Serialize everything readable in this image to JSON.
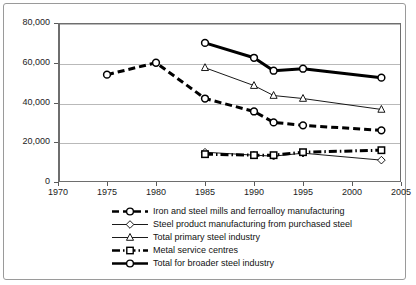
{
  "chart_data": {
    "type": "line",
    "title": "",
    "xlabel": "",
    "ylabel": "",
    "xlim": [
      1970,
      2005
    ],
    "ylim": [
      0,
      80000
    ],
    "grid": true,
    "legend_position": "bottom",
    "yticks": [
      "0",
      "20,000",
      "40,000",
      "60,000",
      "80,000"
    ],
    "ytick_values": [
      0,
      20000,
      40000,
      60000,
      80000
    ],
    "xticks": [
      "1970",
      "1975",
      "1980",
      "1985",
      "1990",
      "1995",
      "2000",
      "2005"
    ],
    "xtick_values": [
      1970,
      1975,
      1980,
      1985,
      1990,
      1995,
      2000,
      2005
    ],
    "series": [
      {
        "name": "Iron and steel mills and ferroalloy manufacturing",
        "marker": "circle",
        "line_style": "dashed",
        "line_width": "thick",
        "x": [
          1975,
          1980,
          1985,
          1990,
          1992,
          1995,
          2003
        ],
        "values": [
          54000,
          60000,
          42000,
          35500,
          30000,
          28500,
          26000
        ]
      },
      {
        "name": "Steel product manufacturing from purchased steel",
        "marker": "diamond",
        "line_style": "solid",
        "line_width": "thin",
        "x": [
          1985,
          1990,
          1992,
          1995,
          2003
        ],
        "values": [
          15000,
          13500,
          13000,
          14500,
          11000
        ]
      },
      {
        "name": "Total primary steel industry",
        "marker": "triangle",
        "line_style": "solid",
        "line_width": "thin",
        "x": [
          1985,
          1990,
          1992,
          1995,
          2003
        ],
        "values": [
          57500,
          48500,
          43500,
          42000,
          36500
        ]
      },
      {
        "name": "Metal service centres",
        "marker": "square",
        "line_style": "dash-dot",
        "line_width": "thick",
        "x": [
          1985,
          1990,
          1992,
          1995,
          2003
        ],
        "values": [
          14000,
          13500,
          13500,
          15000,
          16000
        ]
      },
      {
        "name": "Total for broader steel industry",
        "marker": "circle",
        "line_style": "solid",
        "line_width": "thick",
        "x": [
          1985,
          1990,
          1992,
          1995,
          2003
        ],
        "values": [
          70000,
          62500,
          56000,
          57000,
          52500
        ]
      }
    ]
  },
  "legend": {
    "items": [
      {
        "label": "Iron and steel mills and ferroalloy manufacturing"
      },
      {
        "label": "Steel product manufacturing from purchased steel"
      },
      {
        "label": "Total primary steel industry"
      },
      {
        "label": "Metal service centres"
      },
      {
        "label": "Total for broader steel industry"
      }
    ]
  }
}
